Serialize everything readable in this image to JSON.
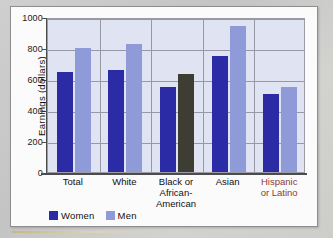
{
  "chart_data": {
    "type": "bar",
    "title": "",
    "xlabel": "",
    "ylabel": "Earnings (dollars)",
    "ylim": [
      0,
      1000
    ],
    "yticks": [
      0,
      200,
      400,
      600,
      800,
      1000
    ],
    "grid": true,
    "legend_position": "bottom-left",
    "categories": [
      "Total",
      "White",
      "Black or African-American",
      "Asian",
      "Hispanic or Latino"
    ],
    "category_labels": [
      "Total",
      "White",
      "Black or\nAfrican-\nAmerican",
      "Asian",
      "Hispanic\nor Latino"
    ],
    "series": [
      {
        "name": "Women",
        "values": [
          645,
          655,
          548,
          750,
          505
        ]
      },
      {
        "name": "Men",
        "values": [
          797,
          825,
          630,
          945,
          548
        ]
      }
    ],
    "colors": {
      "women": "#2b2ba6",
      "men": "#8f9ad8",
      "men_black_category": "#3d3d33",
      "plot_background": "#dfe3f2",
      "gridline": "#9698a6",
      "axis": "#4b4b4b",
      "accent_label": "#8c3a3a",
      "card_background": "#fbfbfb",
      "page_background": "#cdcdcd"
    }
  },
  "axis": {
    "y_title": "Earnings (dollars)",
    "y_ticks": [
      "1000",
      "800",
      "600",
      "400",
      "200",
      "0"
    ]
  },
  "legend": {
    "items": [
      {
        "label": "Women",
        "color": "#2b2ba6"
      },
      {
        "label": "Men",
        "color": "#8f9ad8"
      }
    ]
  }
}
